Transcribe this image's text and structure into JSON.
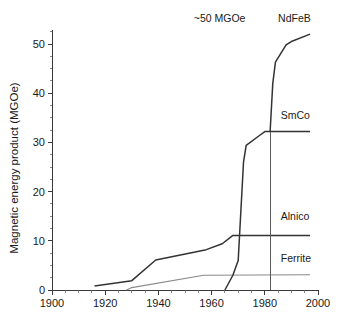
{
  "chart_data": {
    "type": "line",
    "title": "",
    "xlabel": "",
    "ylabel": "Magnetic energy product (MGOe)",
    "xlim": [
      1900,
      2000
    ],
    "ylim": [
      0,
      55
    ],
    "grid": false,
    "legend_position": "right-inline",
    "x_ticks": [
      "1900",
      "1920",
      "1940",
      "1960",
      "1980",
      "2000"
    ],
    "x_tick_values": [
      1900,
      1920,
      1940,
      1960,
      1980,
      2000
    ],
    "x_minor_step": 5,
    "y_ticks": [
      "0",
      "10",
      "20",
      "30",
      "40",
      "50"
    ],
    "y_tick_values": [
      0,
      10,
      20,
      30,
      40,
      50
    ],
    "y_minor_step": 2.5,
    "annotations": [
      {
        "text": "~50 MGOe",
        "x": 1963,
        "y": 54.5
      }
    ],
    "marker_lines": [
      {
        "name": "year-1982-marker",
        "x": 1982,
        "y_from": 0,
        "y_to": 32.2
      }
    ],
    "series": [
      {
        "name": "Alnico",
        "color": "#333333",
        "style": "dark",
        "label_x": 1986,
        "label_y": 14.2,
        "points": [
          [
            1916,
            0.8
          ],
          [
            1930,
            1.9
          ],
          [
            1939,
            6.1
          ],
          [
            1958,
            8.2
          ],
          [
            1964,
            9.4
          ],
          [
            1968,
            11.1
          ],
          [
            1997,
            11.1
          ]
        ]
      },
      {
        "name": "Ferrite",
        "color": "#8a8a8a",
        "style": "light",
        "label_x": 1986,
        "label_y": 5.6,
        "points": [
          [
            1928,
            0.0
          ],
          [
            1930,
            0.5
          ],
          [
            1957,
            3.0
          ],
          [
            1997,
            3.1
          ]
        ]
      },
      {
        "name": "SmCo",
        "color": "#333333",
        "style": "dark",
        "label_x": 1986,
        "label_y": 34.8,
        "points": [
          [
            1965,
            0.0
          ],
          [
            1968,
            3.0
          ],
          [
            1970,
            6.0
          ],
          [
            1972,
            26.0
          ],
          [
            1973,
            29.4
          ],
          [
            1978,
            31.4
          ],
          [
            1980,
            32.2
          ],
          [
            1997,
            32.2
          ]
        ]
      },
      {
        "name": "NdFeB",
        "color": "#333333",
        "style": "dark",
        "label_x": 1985,
        "label_y": 54.5,
        "points": [
          [
            1982,
            32.2
          ],
          [
            1983,
            42.0
          ],
          [
            1984,
            46.3
          ],
          [
            1988,
            49.8
          ],
          [
            1990,
            50.5
          ],
          [
            1997,
            52.0
          ]
        ]
      }
    ]
  },
  "labels": {
    "y_axis_title": "Magnetic energy product (MGOe)",
    "annotation_50mgoe": "~50 MGOe",
    "series_ndfeb": "NdFeB",
    "series_smco": "SmCo",
    "series_alnico": "Alnico",
    "series_ferrite": "Ferrite"
  }
}
